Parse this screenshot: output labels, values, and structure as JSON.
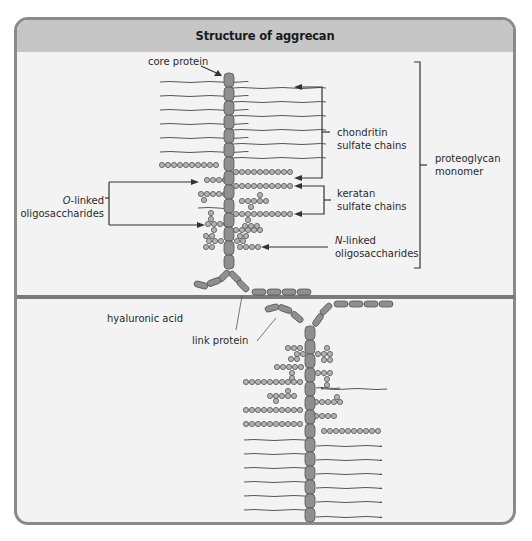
{
  "title": "Structure of aggrecan",
  "labels": {
    "core_protein": "core protein",
    "chondroitin_1": "chondritin",
    "chondroitin_2": "sulfate chains",
    "keratan_1": "keratan",
    "keratan_2": "sulfate chains",
    "n_linked_prefix": "N",
    "n_linked_1": "-linked",
    "n_linked_2": "oligosaccharides",
    "o_linked_prefix": "O",
    "o_linked_1": "-linked",
    "o_linked_2": "oligosaccharides",
    "proteoglycan_1": "proteoglycan",
    "proteoglycan_2": "monomer",
    "hyaluronic_acid": "hyaluronic acid",
    "link_protein": "link protein"
  },
  "colors": {
    "frame_border": "#8a8a8a",
    "header_bg": "#c6c6c6",
    "panel_bg": "#f3f3f3",
    "protein_fill": "#8f8f8f",
    "protein_stroke": "#555555",
    "bead_fill": "#b3b3b3",
    "line": "#333333"
  }
}
